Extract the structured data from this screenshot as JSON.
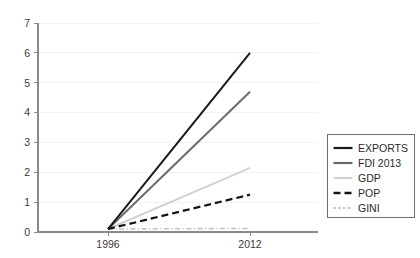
{
  "chart_data": {
    "type": "line",
    "title": "",
    "subtitle": "",
    "xlabel": "",
    "ylabel": "",
    "x": [
      "1996",
      "2012"
    ],
    "xtick_labels": [
      "1996",
      "2012"
    ],
    "ytick_labels": [
      "0",
      "1",
      "2",
      "3",
      "4",
      "5",
      "6",
      "7"
    ],
    "ylim": [
      0,
      7
    ],
    "grid": "horizontal",
    "legend_position": "right",
    "series": [
      {
        "name": "EXPORTS",
        "values": [
          0.1,
          6.0
        ],
        "color": "#1a1a1a",
        "style": "solid",
        "width": 2.0
      },
      {
        "name": "FDI 2013",
        "values": [
          0.1,
          4.7
        ],
        "color": "#6b6b6b",
        "style": "solid",
        "width": 2.0
      },
      {
        "name": "GDP",
        "values": [
          0.1,
          2.15
        ],
        "color": "#d2d2d2",
        "style": "solid",
        "width": 2.0
      },
      {
        "name": "POP",
        "values": [
          0.1,
          1.25
        ],
        "color": "#141414",
        "style": "dashed",
        "width": 2.2
      },
      {
        "name": "GINI",
        "values": [
          0.1,
          0.12
        ],
        "color": "#c4c4c4",
        "style": "dashdot",
        "width": 1.6
      }
    ]
  },
  "legend": {
    "items": [
      {
        "label": "EXPORTS"
      },
      {
        "label": "FDI 2013"
      },
      {
        "label": "GDP"
      },
      {
        "label": "POP"
      },
      {
        "label": "GINI"
      }
    ]
  },
  "axes": {
    "y_ticks": [
      {
        "label": "7"
      },
      {
        "label": "6"
      },
      {
        "label": "5"
      },
      {
        "label": "4"
      },
      {
        "label": "3"
      },
      {
        "label": "2"
      },
      {
        "label": "1"
      },
      {
        "label": "0"
      }
    ],
    "x_ticks": [
      {
        "label": "1996"
      },
      {
        "label": "2012"
      }
    ]
  }
}
